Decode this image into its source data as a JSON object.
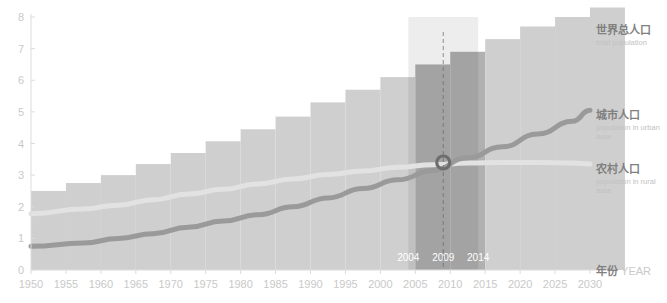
{
  "legend": {
    "total": {
      "cn": "世界总人口",
      "en": "total population"
    },
    "urban": {
      "cn": "城市人口",
      "en": "population in urban area"
    },
    "rural": {
      "cn": "农村人口",
      "en": "population in rural area"
    },
    "year": {
      "cn": "年份",
      "en": "YEAR"
    }
  },
  "colors": {
    "bar": "#cfcfcf",
    "bar_highlight": "#b0b0b0",
    "urban_line": "#9a9a9a",
    "rural_line": "#e2e2e2",
    "marker": "#6e6e6e",
    "axis": "#dcdcdc",
    "tick_text": "#c9c9c9",
    "highlight_text": "#ffffff",
    "legend_cn": "#808080",
    "legend_en": "#c2c2c2",
    "background": "#ffffff"
  },
  "chart_data": {
    "type": "bar",
    "title": "",
    "subtitle": "",
    "xlabel": "年份 YEAR",
    "ylabel": "",
    "xlim": [
      1950,
      2030
    ],
    "ylim": [
      0,
      8
    ],
    "grid": false,
    "legend_position": "right",
    "yticks": [
      0,
      1,
      2,
      3,
      4,
      5,
      6,
      7,
      8
    ],
    "xticks": [
      1950,
      1955,
      1960,
      1965,
      1970,
      1975,
      1980,
      1985,
      1990,
      1995,
      2000,
      2005,
      2010,
      2015,
      2020,
      2025,
      2030
    ],
    "categories": [
      1950,
      1955,
      1960,
      1965,
      1970,
      1975,
      1980,
      1985,
      1990,
      1995,
      2000,
      2005,
      2010,
      2015,
      2020,
      2025,
      2030
    ],
    "series": [
      {
        "name": "世界总人口",
        "name_en": "total population",
        "type": "bar",
        "values": [
          2.5,
          2.75,
          3.0,
          3.35,
          3.7,
          4.07,
          4.45,
          4.85,
          5.3,
          5.7,
          6.1,
          6.5,
          6.9,
          7.3,
          7.7,
          8.0,
          8.3
        ]
      },
      {
        "name": "城市人口",
        "name_en": "population in urban area",
        "type": "line",
        "values": [
          0.75,
          0.85,
          1.0,
          1.15,
          1.35,
          1.55,
          1.75,
          2.0,
          2.28,
          2.58,
          2.85,
          3.15,
          3.55,
          3.9,
          4.3,
          4.7,
          5.05
        ]
      },
      {
        "name": "农村人口",
        "name_en": "population in rural area",
        "type": "line",
        "values": [
          1.78,
          1.93,
          2.05,
          2.22,
          2.4,
          2.55,
          2.72,
          2.88,
          3.02,
          3.13,
          3.25,
          3.33,
          3.38,
          3.4,
          3.4,
          3.38,
          3.35
        ]
      }
    ],
    "highlight_band": {
      "from": 2004,
      "to": 2014,
      "labels": [
        "2004",
        "2009",
        "2014"
      ]
    },
    "marker_line_year": 2009,
    "crossover": {
      "year": 2009,
      "value": 3.4,
      "label": ""
    },
    "annotations": [
      "2004",
      "2009",
      "2014"
    ]
  }
}
